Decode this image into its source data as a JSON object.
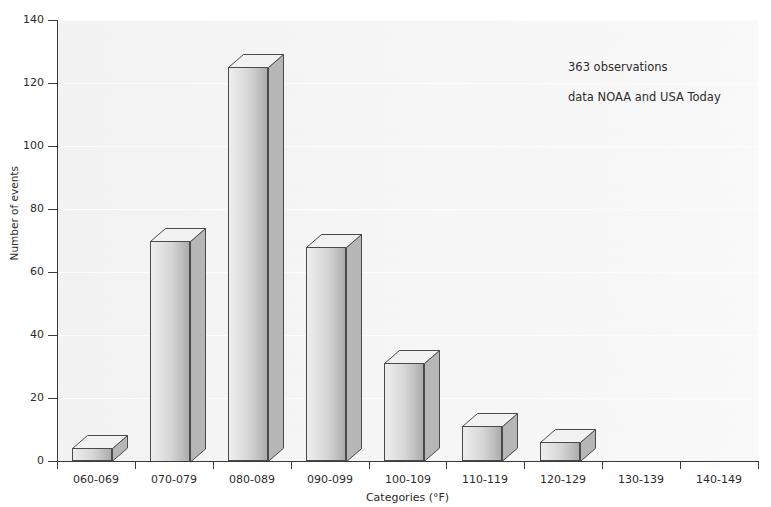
{
  "chart_data": {
    "type": "bar",
    "title": "",
    "subtitle": "",
    "xlabel": "Categories (°F)",
    "ylabel": "Number of events",
    "categories": [
      "060-069",
      "070-079",
      "080-089",
      "090-099",
      "100-109",
      "110-119",
      "120-129",
      "130-139",
      "140-149"
    ],
    "values": [
      4,
      70,
      125,
      68,
      31,
      11,
      6,
      0,
      0
    ],
    "ylim": [
      0,
      140
    ],
    "yticks": [
      0,
      20,
      40,
      60,
      80,
      100,
      120,
      140
    ],
    "ytick_labels": [
      "0",
      "20",
      "40",
      "60",
      "80",
      "100",
      "120",
      "140"
    ],
    "grid": false,
    "legend": "none",
    "style": "3d-bar",
    "annotations": [
      "363 observations",
      "data NOAA and USA Today"
    ]
  },
  "annotations": {
    "observations": "363 observations",
    "source": "data NOAA and USA Today"
  },
  "axes": {
    "y_title": "Number of events",
    "x_title": "Categories (°F)"
  },
  "colors": {
    "bar_face_light": "#eeeeee",
    "bar_face_dark": "#ababab",
    "bar_outline": "#4a4a4a",
    "bar_top": "#f2f2f2",
    "bar_side": "#b6b6b6",
    "plot_background": "#f3f3f3",
    "axis": "#3a3a3a",
    "text": "#2b2b2b"
  }
}
